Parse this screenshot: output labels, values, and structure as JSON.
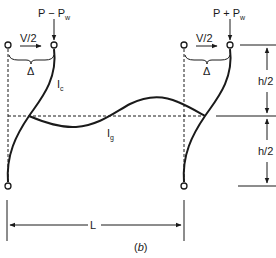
{
  "diagram": {
    "caption": "(b)",
    "caption_letter": "b",
    "loads": {
      "left_axial": "P − P",
      "left_axial_sub": "w",
      "right_axial": "P + P",
      "right_axial_sub": "w",
      "left_shear": "V/2",
      "right_shear": "V/2",
      "left_drift": "Δ",
      "right_drift": "Δ"
    },
    "members": {
      "column_label": "I",
      "column_sub": "c",
      "girder_label": "I",
      "girder_sub": "g"
    },
    "dimensions": {
      "upper_height": "h/2",
      "lower_height": "h/2",
      "span": "L"
    },
    "colors": {
      "ink": "#1a1a1a",
      "background": "#ffffff"
    }
  }
}
